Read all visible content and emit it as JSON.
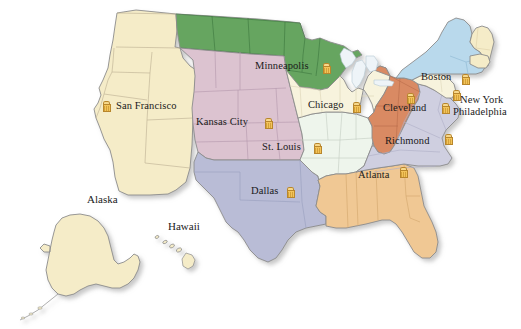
{
  "map": {
    "title": "Federal Reserve Districts of the United States",
    "background_color": "#ffffff",
    "border_color": "#8c8c8c",
    "state_line_color": "#b5a98c",
    "shadow_color": "#c9c9c9",
    "marker_icon": "bank-building-icon",
    "marker_colors": {
      "body": "#f3c45a",
      "roof": "#f7d88a",
      "outline": "#b8862c"
    },
    "label_color": "#1a1a1a"
  },
  "districts": [
    {
      "id": "san-francisco",
      "name": "San Francisco",
      "color": "#f5ecc8"
    },
    {
      "id": "minneapolis",
      "name": "Minneapolis",
      "color": "#66a561"
    },
    {
      "id": "kansas-city",
      "name": "Kansas City",
      "color": "#dcc3d0"
    },
    {
      "id": "dallas",
      "name": "Dallas",
      "color": "#b9bcd6"
    },
    {
      "id": "st-louis",
      "name": "St. Louis",
      "color": "#eef5ec"
    },
    {
      "id": "chicago",
      "name": "Chicago",
      "color": "#f7f3dd"
    },
    {
      "id": "atlanta",
      "name": "Atlanta",
      "color": "#f0c894"
    },
    {
      "id": "cleveland",
      "name": "Cleveland",
      "color": "#d98a63"
    },
    {
      "id": "richmond",
      "name": "Richmond",
      "color": "#cfcfe0"
    },
    {
      "id": "philadelphia",
      "name": "Philadelphia",
      "color": "#f7f3dd"
    },
    {
      "id": "new-york",
      "name": "New York",
      "color": "#b9d9ec"
    },
    {
      "id": "boston",
      "name": "Boston",
      "color": "#f5ecc8"
    }
  ],
  "city_labels": [
    {
      "id": "san-francisco",
      "text": "San Francisco",
      "x": 116,
      "y": 101
    },
    {
      "id": "minneapolis",
      "text": "Minneapolis",
      "x": 255,
      "y": 61
    },
    {
      "id": "kansas-city",
      "text": "Kansas City",
      "x": 196,
      "y": 117
    },
    {
      "id": "st-louis",
      "text": "St. Louis",
      "x": 262,
      "y": 142
    },
    {
      "id": "dallas",
      "text": "Dallas",
      "x": 251,
      "y": 186
    },
    {
      "id": "chicago",
      "text": "Chicago",
      "x": 308,
      "y": 100
    },
    {
      "id": "atlanta",
      "text": "Atlanta",
      "x": 358,
      "y": 170
    },
    {
      "id": "cleveland",
      "text": "Cleveland",
      "x": 383,
      "y": 103
    },
    {
      "id": "richmond",
      "text": "Richmond",
      "x": 385,
      "y": 136
    },
    {
      "id": "boston",
      "text": "Boston",
      "x": 421,
      "y": 72
    },
    {
      "id": "new-york",
      "text": "New York",
      "x": 460,
      "y": 95
    },
    {
      "id": "philadelphia",
      "text": "Philadelphia",
      "x": 453,
      "y": 107
    }
  ],
  "markers": [
    {
      "id": "san-francisco",
      "city": "San Francisco",
      "x": 102,
      "y": 101
    },
    {
      "id": "minneapolis",
      "city": "Minneapolis",
      "x": 322,
      "y": 63
    },
    {
      "id": "kansas-city",
      "city": "Kansas City",
      "x": 264,
      "y": 118
    },
    {
      "id": "st-louis",
      "city": "St. Louis",
      "x": 313,
      "y": 143
    },
    {
      "id": "dallas",
      "city": "Dallas",
      "x": 286,
      "y": 187
    },
    {
      "id": "chicago",
      "city": "Chicago",
      "x": 352,
      "y": 102
    },
    {
      "id": "atlanta",
      "city": "Atlanta",
      "x": 399,
      "y": 167
    },
    {
      "id": "cleveland",
      "city": "Cleveland",
      "x": 406,
      "y": 93
    },
    {
      "id": "richmond",
      "city": "Richmond",
      "x": 444,
      "y": 134
    },
    {
      "id": "boston",
      "city": "Boston",
      "x": 461,
      "y": 74
    },
    {
      "id": "new-york",
      "city": "New York",
      "x": 452,
      "y": 90
    },
    {
      "id": "philadelphia",
      "city": "Philadelphia",
      "x": 441,
      "y": 103
    }
  ],
  "insets": [
    {
      "id": "alaska",
      "text": "Alaska",
      "x": 87,
      "y": 194,
      "color": "#f5ecc8"
    },
    {
      "id": "hawaii",
      "text": "Hawaii",
      "x": 168,
      "y": 221,
      "color": "#f5ecc8"
    }
  ]
}
